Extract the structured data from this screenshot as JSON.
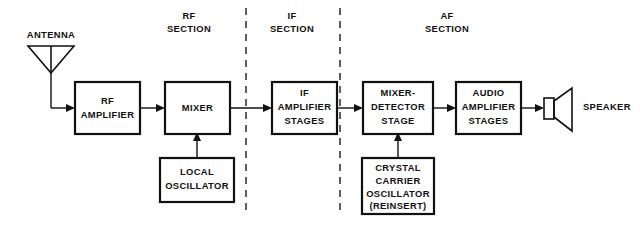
{
  "diagram": {
    "background_color": "#ffffff",
    "line_color": "#111111",
    "sections": [
      {
        "id": "rf",
        "line1": "RF",
        "line2": "SECTION"
      },
      {
        "id": "if",
        "line1": "IF",
        "line2": "SECTION"
      },
      {
        "id": "af",
        "line1": "AF",
        "line2": "SECTION"
      }
    ],
    "blocks": [
      {
        "id": "rf-amplifier",
        "lines": [
          "RF",
          "AMPLIFIER"
        ]
      },
      {
        "id": "mixer",
        "lines": [
          "MIXER"
        ]
      },
      {
        "id": "local-oscillator",
        "lines": [
          "LOCAL",
          "OSCILLATOR"
        ]
      },
      {
        "id": "if-amplifier",
        "lines": [
          "IF",
          "AMPLIFIER",
          "STAGES"
        ]
      },
      {
        "id": "mixer-detector",
        "lines": [
          "MIXER-",
          "DETECTOR",
          "STAGE"
        ]
      },
      {
        "id": "crystal-oscillator",
        "lines": [
          "CRYSTAL",
          "CARRIER",
          "OSCILLATOR",
          "(REINSERT)"
        ]
      },
      {
        "id": "audio-amplifier",
        "lines": [
          "AUDIO",
          "AMPLIFIER",
          "STAGES"
        ]
      }
    ],
    "symbols": [
      {
        "id": "antenna",
        "label": "ANTENNA"
      },
      {
        "id": "speaker",
        "label": "SPEAKER"
      }
    ]
  }
}
